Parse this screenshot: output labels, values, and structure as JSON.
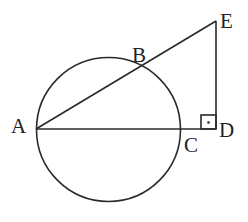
{
  "diagram": {
    "type": "geometry",
    "points": {
      "A": {
        "label": "A",
        "x": 36,
        "y": 129
      },
      "B": {
        "label": "B",
        "x": 140,
        "y": 67
      },
      "C": {
        "label": "C",
        "x": 181,
        "y": 129
      },
      "D": {
        "label": "D",
        "x": 216,
        "y": 129
      },
      "E": {
        "label": "E",
        "x": 216,
        "y": 21
      }
    },
    "circle": {
      "cx": 108.5,
      "cy": 129.5,
      "r": 72,
      "through": [
        "A",
        "B",
        "C"
      ]
    },
    "segments": [
      [
        "A",
        "E"
      ],
      [
        "A",
        "D"
      ],
      [
        "D",
        "E"
      ]
    ],
    "right_angle": {
      "vertex": "D",
      "symbol": "·"
    },
    "colors": {
      "stroke": "#2a2a2a",
      "background": "#ffffff"
    }
  }
}
